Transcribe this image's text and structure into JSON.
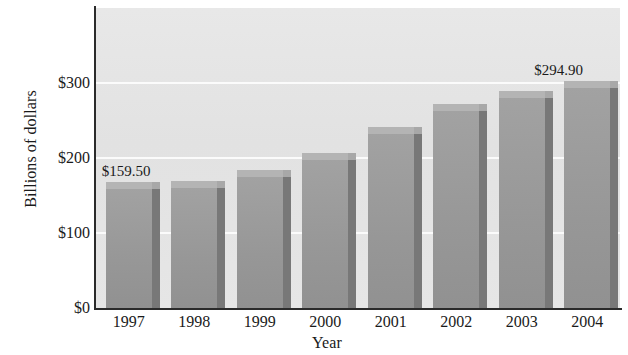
{
  "chart_data": {
    "type": "bar",
    "title": "",
    "xlabel": "Year",
    "ylabel": "Billions of dollars",
    "categories": [
      "1997",
      "1998",
      "1999",
      "2000",
      "2001",
      "2002",
      "2003",
      "2004"
    ],
    "values": [
      159.5,
      161.0,
      176.0,
      199.0,
      233.0,
      264.0,
      281.0,
      294.9
    ],
    "ylim": [
      0,
      400
    ],
    "ytick_labels": [
      "$0",
      "$100",
      "$200",
      "$300"
    ],
    "ytick_values": [
      0,
      100,
      200,
      300
    ],
    "grid": true,
    "legend": null,
    "annotations": [
      {
        "category": "1997",
        "text": "$159.50"
      },
      {
        "category": "2004",
        "text": "$294.90"
      }
    ],
    "colors": {
      "bar_front": "#9b9b9b",
      "bar_side": "#787878",
      "bar_top": "#b4b4b4",
      "plot_background": "#e4e4e4",
      "gridline": "#fbfbfb",
      "axis": "#2b2b2b",
      "text": "#1a1a1a"
    }
  }
}
